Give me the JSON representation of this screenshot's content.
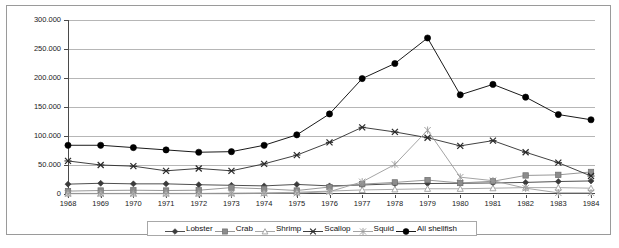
{
  "chart_data": {
    "type": "line",
    "title": "",
    "subtitle": "",
    "xlabel": "",
    "ylabel": "",
    "grid": true,
    "legend_position": "bottom",
    "ylim": [
      0,
      300000
    ],
    "ytick_labels": [
      "300.000",
      "250.000",
      "200.000",
      "150.000",
      "100.000",
      "50.000",
      "0"
    ],
    "ytick_values": [
      300000,
      250000,
      200000,
      150000,
      100000,
      50000,
      0
    ],
    "categories": [
      "1968",
      "1969",
      "1970",
      "1971",
      "1972",
      "1973",
      "1974",
      "1975",
      "1976",
      "1977",
      "1978",
      "1979",
      "1980",
      "1981",
      "1982",
      "1983",
      "1984"
    ],
    "series": [
      {
        "name": "Lobster",
        "marker": "diamond",
        "color": "#3b3b3b",
        "values": [
          17000,
          18500,
          17500,
          17500,
          16000,
          15000,
          14000,
          16500,
          14000,
          15500,
          17500,
          18000,
          18500,
          19000,
          20000,
          21500,
          22500
        ]
      },
      {
        "name": "Crab",
        "marker": "square",
        "color": "#8c8c8c",
        "values": [
          5000,
          6000,
          6500,
          6000,
          6500,
          11000,
          9000,
          6000,
          12000,
          17000,
          20000,
          24000,
          19000,
          22000,
          32000,
          33000,
          38000
        ]
      },
      {
        "name": "Shrimp",
        "marker": "triangle",
        "color": "#9e9e9e",
        "values": [
          1000,
          1000,
          1000,
          1000,
          1000,
          1500,
          2000,
          3000,
          5000,
          7000,
          8000,
          9000,
          9000,
          10000,
          11000,
          11000,
          10000
        ]
      },
      {
        "name": "Scallop",
        "marker": "x",
        "color": "#2b2b2b",
        "values": [
          57000,
          50000,
          48000,
          40000,
          44000,
          40000,
          52000,
          67000,
          89000,
          115000,
          107000,
          97000,
          83000,
          92000,
          72000,
          54000,
          31000
        ]
      },
      {
        "name": "Squid",
        "marker": "asterisk",
        "color": "#9a9a9a",
        "values": [
          500,
          500,
          500,
          500,
          500,
          500,
          1000,
          1500,
          4000,
          21000,
          51000,
          110000,
          29000,
          23000,
          10000,
          2000,
          2000
        ]
      },
      {
        "name": "All shellfish",
        "marker": "circle",
        "color": "#000000",
        "values": [
          84000,
          84000,
          80000,
          76000,
          72000,
          73000,
          84000,
          102000,
          138000,
          199000,
          225000,
          269000,
          171000,
          189000,
          167000,
          137000,
          128000
        ]
      }
    ]
  },
  "legend": {
    "items": [
      {
        "label": "Lobster",
        "marker": "diamond"
      },
      {
        "label": "Crab",
        "marker": "square"
      },
      {
        "label": "Shrimp",
        "marker": "triangle"
      },
      {
        "label": "Scallop",
        "marker": "x"
      },
      {
        "label": "Squid",
        "marker": "asterisk"
      },
      {
        "label": "All shellfish",
        "marker": "circle"
      }
    ]
  }
}
